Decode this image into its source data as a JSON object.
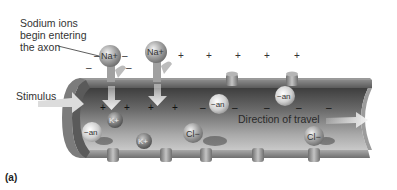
{
  "figure": {
    "panel_label": "(a)",
    "annotations": {
      "sodium_entry": [
        "Sodium ions",
        "begin entering",
        "the axon"
      ],
      "stimulus": "Stimulus",
      "direction": "Direction of travel"
    },
    "ions": {
      "sodium_1": "Na+",
      "sodium_2": "Na+",
      "potassium_1": "K+",
      "potassium_2": "K+",
      "chloride_1": "Cl−",
      "chloride_2": "Cl−",
      "anion_1": "−an",
      "anion_2": "−an",
      "anion_3": "−an"
    },
    "charges": {
      "plus": "+",
      "minus": "–"
    },
    "colors": {
      "axon_dark": "#4a4a4a",
      "axon_light": "#bdbdbd",
      "membrane": "#8c8c8c",
      "ion": "#9a9a9a",
      "arrow": "#e8e8e8"
    }
  }
}
